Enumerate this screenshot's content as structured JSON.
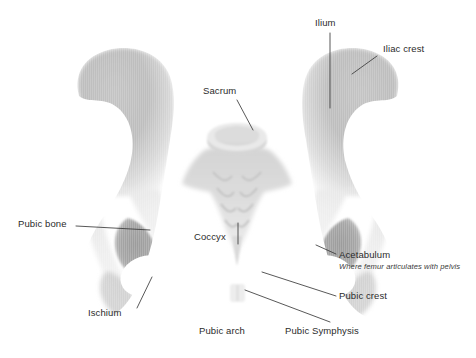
{
  "figure": {
    "background_color": "#ffffff",
    "bone_fill_light": "#f2f2f2",
    "bone_fill_mid": "#bcbcbc",
    "bone_fill_dark": "#9e9e9e",
    "label_color": "#2b2b2b",
    "leader_line_color": "#3a3a3a"
  },
  "labels": {
    "ilium": "Ilium",
    "iliac_crest": "Iliac crest",
    "sacrum": "Sacrum",
    "coccyx": "Coccyx",
    "pubic_bone": "Pubic bone",
    "ischium": "Ischium",
    "acetabulum": "Acetabulum",
    "acetabulum_note": "Where femur articulates with pelvis",
    "pubic_crest": "Pubic crest",
    "pubic_symphysis": "Pubic Symphysis",
    "pubic_arch": "Pubic arch"
  },
  "structures": [
    {
      "name": "ilium",
      "label": "Ilium",
      "side": "right"
    },
    {
      "name": "iliac-crest",
      "label": "Iliac crest",
      "side": "right"
    },
    {
      "name": "sacrum",
      "label": "Sacrum",
      "side": "center"
    },
    {
      "name": "coccyx",
      "label": "Coccyx",
      "side": "center"
    },
    {
      "name": "pubic-bone",
      "label": "Pubic bone",
      "side": "left"
    },
    {
      "name": "ischium",
      "label": "Ischium",
      "side": "left"
    },
    {
      "name": "acetabulum",
      "label": "Acetabulum",
      "side": "right"
    },
    {
      "name": "pubic-crest",
      "label": "Pubic crest",
      "side": "right"
    },
    {
      "name": "pubic-symphysis",
      "label": "Pubic Symphysis",
      "side": "center"
    },
    {
      "name": "pubic-arch",
      "label": "Pubic arch",
      "side": "center"
    }
  ]
}
